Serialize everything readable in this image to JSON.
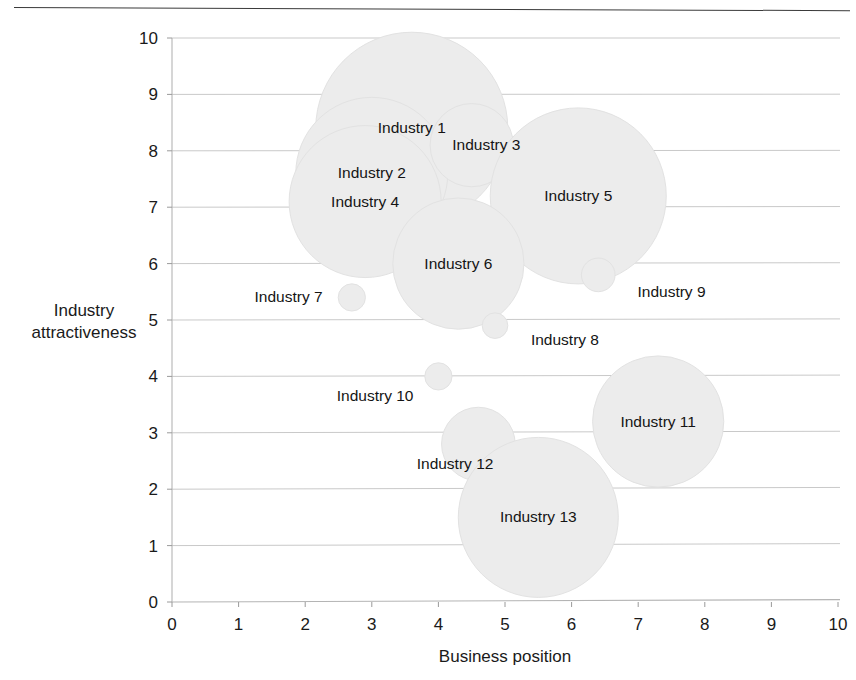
{
  "chart_data": {
    "type": "scatter",
    "title": "",
    "xlabel": "Business position",
    "ylabel": "Industry attractiveness",
    "xlim": [
      0,
      10
    ],
    "ylim": [
      0,
      10
    ],
    "xticks": [
      "0",
      "1",
      "2",
      "3",
      "4",
      "5",
      "6",
      "7",
      "8",
      "9",
      "10"
    ],
    "yticks": [
      "0",
      "1",
      "2",
      "3",
      "4",
      "5",
      "6",
      "7",
      "8",
      "9",
      "10"
    ],
    "grid": "horizontal",
    "legend": "none",
    "bubble_color": "#ececec",
    "points": [
      {
        "label": "Industry 1",
        "x": 3.6,
        "y": 8.4,
        "size": 1.2,
        "label_dx": 0.0,
        "label_dy": 0.0
      },
      {
        "label": "Industry 2",
        "x": 3.0,
        "y": 7.6,
        "size": 0.95,
        "label_dx": 0.0,
        "label_dy": 0.0
      },
      {
        "label": "Industry 3",
        "x": 4.5,
        "y": 8.1,
        "size": 0.52,
        "label_dx": 0.22,
        "label_dy": 0.0
      },
      {
        "label": "Industry 4",
        "x": 2.9,
        "y": 7.1,
        "size": 0.95,
        "label_dx": 0.0,
        "label_dy": 0.0
      },
      {
        "label": "Industry 5",
        "x": 6.1,
        "y": 7.2,
        "size": 1.1,
        "label_dx": 0.0,
        "label_dy": 0.0
      },
      {
        "label": "Industry 6",
        "x": 4.3,
        "y": 6.0,
        "size": 0.82,
        "label_dx": 0.0,
        "label_dy": 0.0
      },
      {
        "label": "Industry 7",
        "x": 2.7,
        "y": 5.4,
        "size": 0.17,
        "label_dx": -0.95,
        "label_dy": 0.0
      },
      {
        "label": "Industry 8",
        "x": 4.85,
        "y": 4.9,
        "size": 0.16,
        "label_dx": 1.05,
        "label_dy": -0.25
      },
      {
        "label": "Industry 9",
        "x": 6.4,
        "y": 5.8,
        "size": 0.21,
        "label_dx": 1.1,
        "label_dy": -0.3
      },
      {
        "label": "Industry 10",
        "x": 4.0,
        "y": 4.0,
        "size": 0.17,
        "label_dx": -0.95,
        "label_dy": -0.35
      },
      {
        "label": "Industry 11",
        "x": 7.3,
        "y": 3.2,
        "size": 0.82,
        "label_dx": 0.0,
        "label_dy": 0.0
      },
      {
        "label": "Industry 12",
        "x": 4.6,
        "y": 2.8,
        "size": 0.46,
        "label_dx": -0.35,
        "label_dy": -0.35
      },
      {
        "label": "Industry 13",
        "x": 5.5,
        "y": 1.5,
        "size": 1.0,
        "label_dx": 0.0,
        "label_dy": 0.0
      }
    ]
  }
}
